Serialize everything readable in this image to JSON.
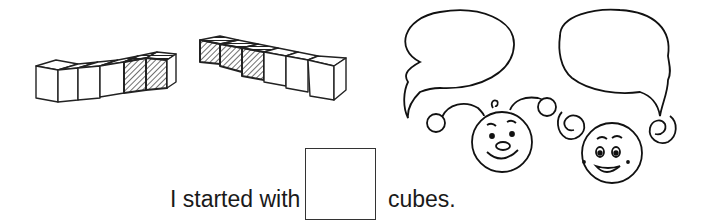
{
  "worksheet": {
    "sentence_start": "I started with",
    "answer_value": "",
    "sentence_end": "cubes.",
    "cube_trains": [
      {
        "name": "left-train",
        "cubes": [
          "white",
          "white",
          "white",
          "white",
          "hatched",
          "hatched"
        ]
      },
      {
        "name": "right-train",
        "cubes": [
          "hatched",
          "hatched",
          "hatched",
          "white",
          "white",
          "white"
        ]
      }
    ],
    "speech_bubbles": [
      {
        "speaker": "boy-character",
        "text": ""
      },
      {
        "speaker": "girl-character",
        "text": ""
      }
    ]
  }
}
